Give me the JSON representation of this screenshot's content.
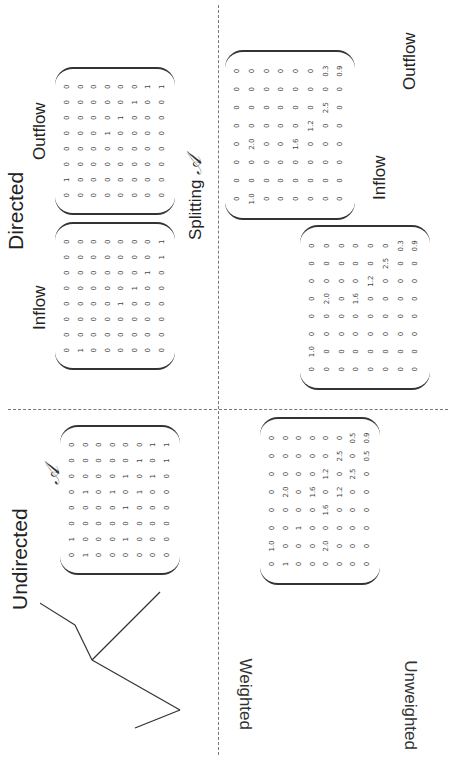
{
  "titles": {
    "undirected": "Undirected",
    "directed": "Directed",
    "inflow": "Inflow",
    "outflow": "Outflow",
    "inflow_w": "Inflow",
    "outflow_w": "Outflow"
  },
  "row_labels": {
    "unweighted": "Unweighted",
    "weighted": "Weighted"
  },
  "splitting_label": "Splitting",
  "matrix_symbol": "𝒜",
  "nodes": [
    "α",
    "β",
    "γ",
    "δ",
    "ε",
    "ζ",
    "η",
    "θ"
  ],
  "matrices": {
    "undirected_unweighted": [
      [
        "0",
        "1",
        "0",
        "0",
        "0",
        "0",
        "0",
        "0"
      ],
      [
        "1",
        "0",
        "0",
        "0",
        "1",
        "0",
        "0",
        "0"
      ],
      [
        "0",
        "0",
        "0",
        "0",
        "0",
        "0",
        "0",
        "0"
      ],
      [
        "0",
        "0",
        "0",
        "0",
        "1",
        "0",
        "0",
        "0"
      ],
      [
        "0",
        "1",
        "0",
        "1",
        "0",
        "1",
        "0",
        "0"
      ],
      [
        "0",
        "0",
        "0",
        "0",
        "1",
        "0",
        "1",
        "0"
      ],
      [
        "0",
        "0",
        "0",
        "0",
        "0",
        "1",
        "0",
        "1"
      ],
      [
        "0",
        "0",
        "0",
        "0",
        "0",
        "0",
        "1",
        "1"
      ]
    ],
    "directed_inflow": [
      [
        "0",
        "0",
        "0",
        "0",
        "0",
        "0",
        "0",
        "0"
      ],
      [
        "1",
        "0",
        "0",
        "0",
        "0",
        "0",
        "0",
        "0"
      ],
      [
        "0",
        "0",
        "0",
        "0",
        "0",
        "0",
        "0",
        "0"
      ],
      [
        "0",
        "0",
        "0",
        "0",
        "0",
        "0",
        "0",
        "0"
      ],
      [
        "0",
        "0",
        "0",
        "1",
        "0",
        "0",
        "0",
        "0"
      ],
      [
        "0",
        "0",
        "0",
        "0",
        "1",
        "0",
        "0",
        "0"
      ],
      [
        "0",
        "0",
        "0",
        "0",
        "0",
        "1",
        "0",
        "0"
      ],
      [
        "0",
        "0",
        "0",
        "0",
        "0",
        "0",
        "1",
        "1"
      ]
    ],
    "directed_outflow": [
      [
        "0",
        "1",
        "0",
        "0",
        "0",
        "0",
        "0",
        "0"
      ],
      [
        "0",
        "0",
        "0",
        "0",
        "0",
        "0",
        "0",
        "0"
      ],
      [
        "0",
        "0",
        "0",
        "0",
        "0",
        "0",
        "0",
        "0"
      ],
      [
        "0",
        "0",
        "0",
        "0",
        "1",
        "0",
        "0",
        "0"
      ],
      [
        "0",
        "0",
        "0",
        "0",
        "0",
        "1",
        "0",
        "0"
      ],
      [
        "0",
        "0",
        "0",
        "0",
        "0",
        "0",
        "1",
        "0"
      ],
      [
        "0",
        "0",
        "0",
        "0",
        "0",
        "0",
        "0",
        "1"
      ],
      [
        "0",
        "0",
        "0",
        "0",
        "0",
        "0",
        "0",
        "1"
      ]
    ],
    "undirected_weighted": [
      [
        "0",
        "1.0",
        "0",
        "0",
        "0",
        "0",
        "0",
        "0"
      ],
      [
        "1",
        "0",
        "0",
        "0",
        "2.0",
        "0",
        "0",
        "0"
      ],
      [
        "0",
        "0",
        "1",
        "0",
        "0",
        "0",
        "0",
        "0"
      ],
      [
        "0",
        "0",
        "0",
        "0",
        "1.6",
        "0",
        "0",
        "0"
      ],
      [
        "0",
        "2.0",
        "0",
        "1.6",
        "0",
        "1.2",
        "0",
        "0"
      ],
      [
        "0",
        "0",
        "0",
        "0",
        "1.2",
        "0",
        "2.5",
        "0"
      ],
      [
        "0",
        "0",
        "0",
        "0",
        "0",
        "2.5",
        "0",
        "0.5"
      ],
      [
        "0",
        "0",
        "0",
        "0",
        "0",
        "0",
        "0.5",
        "0.9"
      ]
    ],
    "weighted_inflow": [
      [
        "0",
        "0",
        "0",
        "0",
        "0",
        "0",
        "0",
        "0"
      ],
      [
        "1.0",
        "0",
        "0",
        "2.0",
        "0",
        "0",
        "0",
        "0"
      ],
      [
        "0",
        "0",
        "0",
        "0",
        "0",
        "0",
        "0",
        "0"
      ],
      [
        "0",
        "0",
        "0",
        "0",
        "0",
        "0",
        "0",
        "0"
      ],
      [
        "0",
        "0",
        "0",
        "1.6",
        "0",
        "0",
        "0",
        "0"
      ],
      [
        "0",
        "0",
        "0",
        "0",
        "1.2",
        "0",
        "0",
        "0"
      ],
      [
        "0",
        "0",
        "0",
        "0",
        "0",
        "2.5",
        "0",
        "0.3"
      ],
      [
        "0",
        "0",
        "0",
        "0",
        "0",
        "0",
        "0",
        "0.9"
      ]
    ],
    "weighted_outflow": [
      [
        "0",
        "1.0",
        "0",
        "0",
        "0",
        "0",
        "0",
        "0"
      ],
      [
        "0",
        "0",
        "0",
        "0",
        "2.0",
        "0",
        "0",
        "0"
      ],
      [
        "0",
        "0",
        "0",
        "0",
        "0",
        "0",
        "0",
        "0"
      ],
      [
        "0",
        "0",
        "0",
        "0",
        "1.6",
        "0",
        "0",
        "0"
      ],
      [
        "0",
        "0",
        "0",
        "0",
        "0",
        "1.2",
        "0",
        "0"
      ],
      [
        "0",
        "0",
        "0",
        "0",
        "0",
        "0",
        "2.5",
        "0"
      ],
      [
        "0",
        "0",
        "0",
        "0",
        "0",
        "0",
        "0",
        "0.3"
      ],
      [
        "0",
        "0",
        "0",
        "0",
        "0",
        "0",
        "0",
        "0.9"
      ]
    ]
  },
  "edge_weights": {
    "alpha_beta": "1.0",
    "beta_epsilon": "2.0",
    "delta_epsilon": "1.6",
    "epsilon_zeta": "1.2",
    "zeta_eta": "2.5",
    "eta_theta_undirected": "0.5",
    "theta_eta_directed": "0.3",
    "theta_self": "0.9"
  }
}
